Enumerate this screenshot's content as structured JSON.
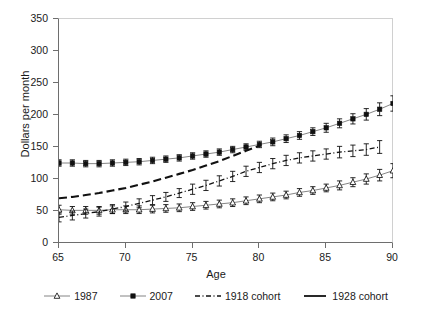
{
  "chart_data": {
    "type": "line",
    "title": "",
    "xlabel": "Age",
    "ylabel": "Dollars per month",
    "xlim": [
      65,
      90
    ],
    "ylim": [
      0,
      350
    ],
    "xticks": [
      65,
      70,
      75,
      80,
      85,
      90
    ],
    "yticks": [
      0,
      50,
      100,
      150,
      200,
      250,
      300,
      350
    ],
    "grid": false,
    "legend_position": "bottom",
    "error_bars": true,
    "x": [
      65,
      66,
      67,
      68,
      69,
      70,
      71,
      72,
      73,
      74,
      75,
      76,
      77,
      78,
      79,
      80,
      81,
      82,
      83,
      84,
      85,
      86,
      87,
      88,
      89,
      90
    ],
    "series": [
      {
        "name": "1987",
        "marker": "open-triangle",
        "line": "solid",
        "values": [
          52,
          51,
          51,
          51,
          52,
          52,
          52,
          53,
          54,
          55,
          57,
          59,
          61,
          63,
          66,
          69,
          72,
          75,
          79,
          82,
          86,
          90,
          95,
          100,
          106,
          113
        ],
        "err": [
          7,
          6,
          6,
          6,
          6,
          6,
          6,
          6,
          6,
          6,
          6,
          6,
          6,
          6,
          6,
          6,
          6,
          6,
          6,
          6,
          6,
          7,
          7,
          8,
          9,
          11
        ]
      },
      {
        "name": "2007",
        "marker": "filled-square",
        "line": "solid",
        "values": [
          125,
          125,
          124,
          124,
          125,
          126,
          127,
          129,
          131,
          133,
          136,
          139,
          142,
          146,
          150,
          154,
          158,
          163,
          168,
          174,
          180,
          187,
          194,
          201,
          209,
          218
        ],
        "err": [
          5,
          5,
          5,
          5,
          5,
          5,
          5,
          5,
          5,
          5,
          5,
          5,
          5,
          5,
          5,
          5,
          6,
          6,
          6,
          6,
          7,
          7,
          8,
          9,
          10,
          12
        ]
      },
      {
        "name": "1918 cohort",
        "marker": "error-bar",
        "line": "dash-dot",
        "values": [
          40,
          43,
          46,
          49,
          53,
          57,
          62,
          67,
          72,
          78,
          84,
          90,
          97,
          104,
          112,
          118,
          124,
          129,
          133,
          136,
          139,
          142,
          144,
          146,
          150,
          null
        ],
        "err": [
          7,
          7,
          7,
          7,
          7,
          7,
          7,
          7,
          7,
          7,
          8,
          8,
          8,
          8,
          8,
          8,
          8,
          8,
          8,
          8,
          8,
          9,
          9,
          9,
          10,
          null
        ]
      },
      {
        "name": "1928 cohort",
        "marker": "none",
        "line": "dashed-thick",
        "values": [
          70,
          72,
          75,
          78,
          82,
          86,
          91,
          96,
          102,
          108,
          114,
          121,
          128,
          136,
          144,
          152,
          null,
          null,
          null,
          null,
          null,
          null,
          null,
          null,
          null,
          null
        ],
        "err": [
          null,
          null,
          null,
          null,
          null,
          null,
          null,
          null,
          null,
          null,
          null,
          null,
          null,
          null,
          null,
          null,
          null,
          null,
          null,
          null,
          null,
          null,
          null,
          null,
          null,
          null
        ]
      }
    ],
    "legend": [
      {
        "label": "1987",
        "style": "open-triangle-line"
      },
      {
        "label": "2007",
        "style": "filled-square-line"
      },
      {
        "label": "1918 cohort",
        "style": "dash-dot-line"
      },
      {
        "label": "1928 cohort",
        "style": "solid-thick-line"
      }
    ]
  },
  "axes": {
    "y_tick_labels": [
      "350",
      "300",
      "250",
      "200",
      "150",
      "100",
      "50",
      "0"
    ],
    "x_tick_labels": [
      "65",
      "70",
      "75",
      "80",
      "85",
      "90"
    ],
    "x_title": "Age",
    "y_title": "Dollars per month"
  },
  "colors": {
    "axis": "#6e6e6e",
    "frame_light": "#d0d0d0",
    "series_dark": "#111111",
    "text": "#1a1a1a",
    "background": "#ffffff"
  }
}
